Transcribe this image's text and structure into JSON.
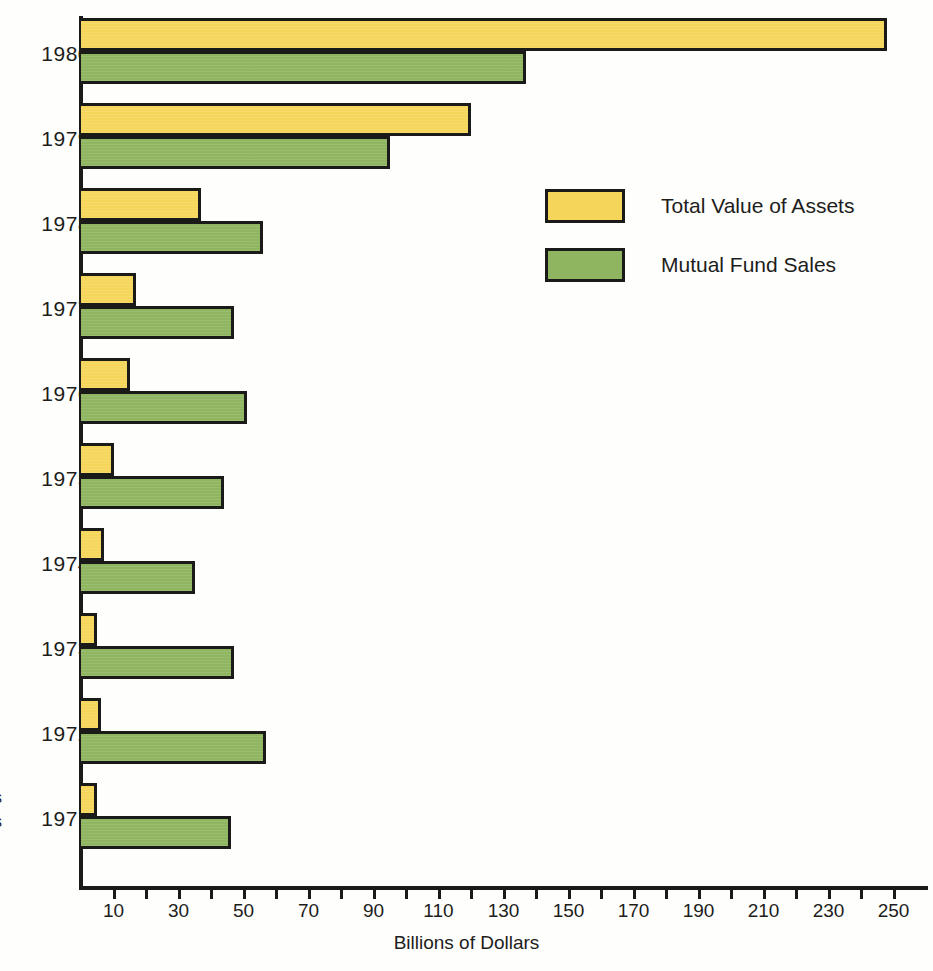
{
  "chart_data": {
    "type": "bar",
    "orientation": "horizontal",
    "title": "",
    "xlabel": "Billions of Dollars",
    "ylabel": "",
    "xlim": [
      0,
      260
    ],
    "grid": false,
    "legend_position": "inside-upper-right",
    "categories": [
      "1980",
      "1979",
      "1978",
      "1977",
      "1976",
      "1975",
      "1974",
      "1973",
      "1972",
      "1971"
    ],
    "series": [
      {
        "name": "Total Value of Assets",
        "color": "#f5d65a",
        "values": [
          248,
          120,
          37,
          17,
          15,
          10,
          7,
          5,
          6,
          5
        ]
      },
      {
        "name": "Mutual Fund Sales",
        "color": "#8fb560",
        "values": [
          137,
          95,
          56,
          47,
          51,
          44,
          35,
          47,
          57,
          46
        ]
      }
    ],
    "tick_values": [
      10,
      20,
      30,
      40,
      50,
      60,
      70,
      80,
      90,
      100,
      110,
      120,
      130,
      140,
      150,
      160,
      170,
      180,
      190,
      200,
      210,
      220,
      230,
      240,
      250
    ],
    "tick_labels": [
      {
        "value": 10,
        "label": "10"
      },
      {
        "value": 30,
        "label": "30"
      },
      {
        "value": 50,
        "label": "50"
      },
      {
        "value": 70,
        "label": "70"
      },
      {
        "value": 90,
        "label": "90"
      },
      {
        "value": 110,
        "label": "110"
      },
      {
        "value": 130,
        "label": "130"
      },
      {
        "value": 150,
        "label": "150"
      },
      {
        "value": 170,
        "label": "170"
      },
      {
        "value": 190,
        "label": "190"
      },
      {
        "value": 210,
        "label": "210"
      },
      {
        "value": 230,
        "label": "230"
      },
      {
        "value": 250,
        "label": "250"
      }
    ]
  },
  "legend": {
    "items": [
      {
        "label": "Total Value of Assets",
        "swatch_class": "assets"
      },
      {
        "label": "Mutual Fund Sales",
        "swatch_class": "sales"
      }
    ]
  },
  "axis": {
    "x_title": "Billions of Dollars"
  },
  "side_caption": {
    "lines": [
      "s",
      "s",
      "l"
    ]
  },
  "colors": {
    "assets": "#f5d65a",
    "sales": "#8fb560",
    "ink": "#1a1a18",
    "background": "#fefefd"
  }
}
